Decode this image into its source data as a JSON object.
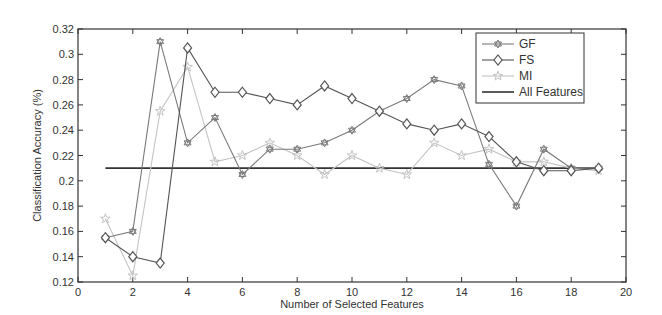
{
  "chart_data": {
    "type": "line",
    "title": "",
    "xlabel": "Number of Selected Features",
    "ylabel": "Classification Accuracy (%)",
    "xlim": [
      0,
      20
    ],
    "ylim": [
      0.12,
      0.32
    ],
    "xticks": [
      0,
      2,
      4,
      6,
      8,
      10,
      12,
      14,
      16,
      18,
      20
    ],
    "yticks": [
      0.12,
      0.14,
      0.16,
      0.18,
      0.2,
      0.22,
      0.24,
      0.26,
      0.28,
      0.3,
      0.32
    ],
    "ytick_labels": [
      "0.12",
      "0.14",
      "0.16",
      "0.18",
      "0.2",
      "0.22",
      "0.24",
      "0.26",
      "0.28",
      "0.3",
      "0.32"
    ],
    "grid": false,
    "legend_position": "upper right",
    "x": [
      1,
      2,
      3,
      4,
      5,
      6,
      7,
      8,
      9,
      10,
      11,
      12,
      13,
      14,
      15,
      16,
      17,
      18,
      19
    ],
    "series": [
      {
        "name": "GF",
        "marker": "hexagram",
        "color": "#7a7a7a",
        "values": [
          0.155,
          0.16,
          0.31,
          0.23,
          0.25,
          0.205,
          0.225,
          0.225,
          0.23,
          0.24,
          0.255,
          0.265,
          0.28,
          0.275,
          0.213,
          0.18,
          0.225,
          0.21,
          0.21
        ]
      },
      {
        "name": "FS",
        "marker": "diamond",
        "color": "#555555",
        "values": [
          0.155,
          0.14,
          0.135,
          0.305,
          0.27,
          0.27,
          0.265,
          0.26,
          0.275,
          0.265,
          0.255,
          0.245,
          0.24,
          0.245,
          0.235,
          0.215,
          0.208,
          0.208,
          0.21
        ]
      },
      {
        "name": "MI",
        "marker": "star",
        "color": "#c4c4c4",
        "values": [
          0.17,
          0.125,
          0.255,
          0.29,
          0.215,
          0.22,
          0.23,
          0.22,
          0.205,
          0.22,
          0.21,
          0.205,
          0.23,
          0.22,
          0.225,
          0.215,
          0.215,
          0.21,
          0.208
        ]
      },
      {
        "name": "All Features",
        "marker": "none",
        "color": "#333333",
        "constant": 0.21,
        "x_range": [
          1,
          19
        ]
      }
    ]
  }
}
